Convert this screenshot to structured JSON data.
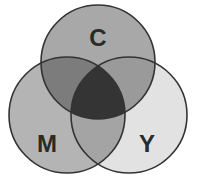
{
  "diagram": {
    "type": "venn",
    "sets": [
      {
        "id": "C",
        "label": "C",
        "cx": 98,
        "cy": 62,
        "r": 57,
        "fill": "#a8a8a8"
      },
      {
        "id": "M",
        "label": "M",
        "cx": 67,
        "cy": 115,
        "r": 58,
        "fill": "#b4b4b4"
      },
      {
        "id": "Y",
        "label": "Y",
        "cx": 129,
        "cy": 115,
        "r": 58,
        "fill": "#e2e2e2"
      }
    ],
    "colors": {
      "C_only": "#a8a8a8",
      "M_only": "#b4b4b4",
      "Y_only": "#e2e2e2",
      "CM": "#7c7c7c",
      "CY": "#9a9a9a",
      "MY": "#a4a4a4",
      "CMY": "#343434",
      "stroke": "#333333"
    },
    "labels": {
      "C": "C",
      "M": "M",
      "Y": "Y"
    }
  }
}
